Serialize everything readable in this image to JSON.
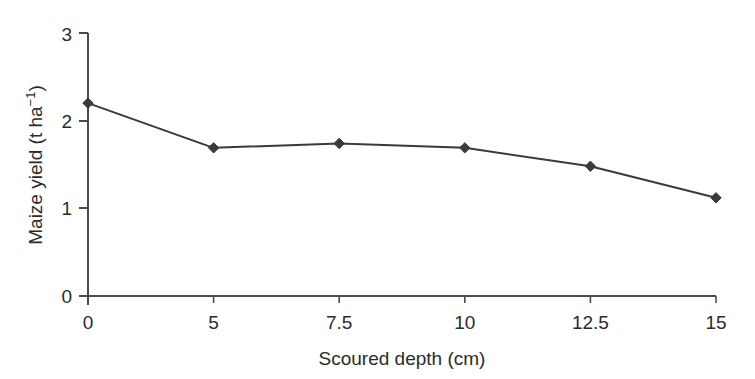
{
  "chart_data": {
    "type": "line",
    "title": "",
    "xlabel": "Scoured depth (cm)",
    "ylabel": "Maize yield (t ha−1)",
    "ylabel_parts": {
      "main": "Maize yield (t ha",
      "superscript": "−1",
      "tail": ")"
    },
    "categories": [
      "0",
      "5",
      "7.5",
      "10",
      "12.5",
      "15"
    ],
    "x": [
      0,
      5,
      7.5,
      10,
      12.5,
      15
    ],
    "x_axis_scale": "categorical-even-spacing",
    "values": [
      2.2,
      1.69,
      1.74,
      1.69,
      1.48,
      1.12
    ],
    "series": [
      {
        "name": "Maize yield",
        "values": [
          2.2,
          1.69,
          1.74,
          1.69,
          1.48,
          1.12
        ]
      }
    ],
    "ylim": [
      0,
      3
    ],
    "yticks": [
      0,
      1,
      2,
      3
    ],
    "ytick_labels": [
      "0",
      "1",
      "2",
      "3"
    ],
    "grid": false,
    "legend": "none",
    "marker": "diamond",
    "line_color": "#3a3a3a",
    "marker_color": "#3a3a3a",
    "axis_color": "#4a4a4a",
    "background_color": "#ffffff"
  },
  "axes": {
    "y_tick_0": "0",
    "y_tick_1": "1",
    "y_tick_2": "2",
    "y_tick_3": "3",
    "x_tick_0": "0",
    "x_tick_1": "5",
    "x_tick_2": "7.5",
    "x_tick_3": "10",
    "x_tick_4": "12.5",
    "x_tick_5": "15"
  }
}
